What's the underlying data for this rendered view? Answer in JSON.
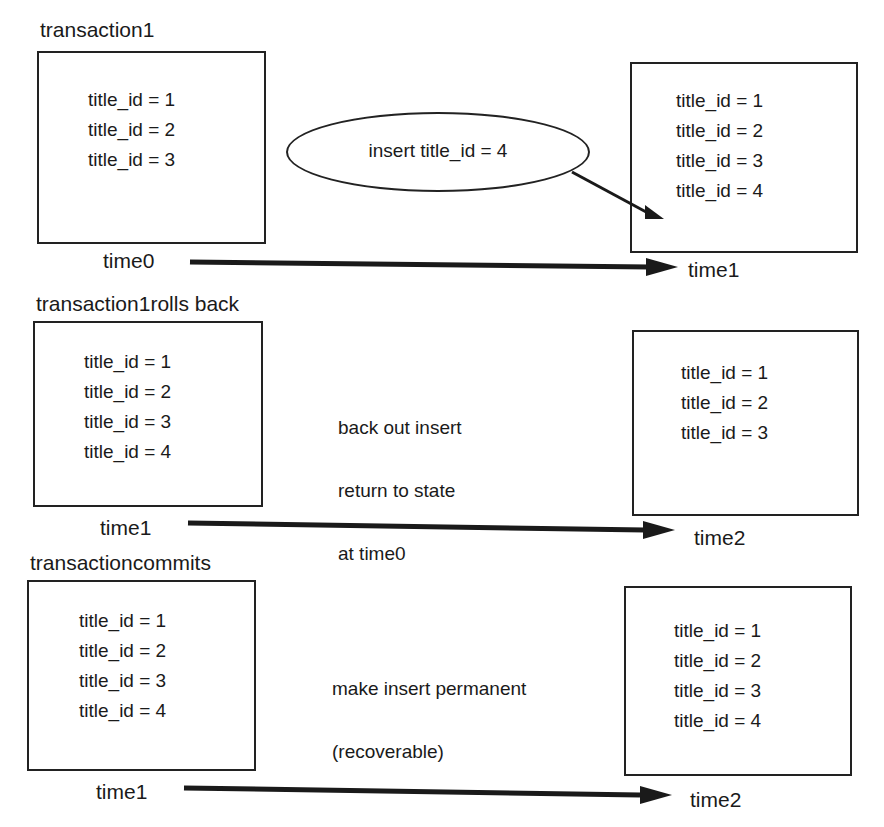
{
  "panels": [
    {
      "heading": "transaction1",
      "left_box": {
        "rows": [
          "title_id = 1",
          "title_id = 2",
          "title_id = 3"
        ]
      },
      "right_box": {
        "rows": [
          "title_id = 1",
          "title_id = 2",
          "title_id = 3",
          "title_id = 4"
        ]
      },
      "action_ellipse": "insert title_id = 4",
      "start_time": "time0",
      "end_time": "time1"
    },
    {
      "heading": "transaction1rolls back",
      "left_box": {
        "rows": [
          "title_id = 1",
          "title_id = 2",
          "title_id = 3",
          "title_id = 4"
        ]
      },
      "right_box": {
        "rows": [
          "title_id = 1",
          "title_id = 2",
          "title_id = 3"
        ]
      },
      "note_lines": [
        "back out insert",
        "return to state",
        "at time0"
      ],
      "start_time": "time1",
      "end_time": "time2"
    },
    {
      "heading": "transactioncommits",
      "left_box": {
        "rows": [
          "title_id = 1",
          "title_id = 2",
          "title_id = 3",
          "title_id = 4"
        ]
      },
      "right_box": {
        "rows": [
          "title_id = 1",
          "title_id = 2",
          "title_id = 3",
          "title_id = 4"
        ]
      },
      "note_lines": [
        "make insert permanent",
        "(recoverable)"
      ],
      "start_time": "time1",
      "end_time": "time2"
    }
  ],
  "colors": {
    "ink": "#1a1a1a",
    "background": "#ffffff"
  }
}
